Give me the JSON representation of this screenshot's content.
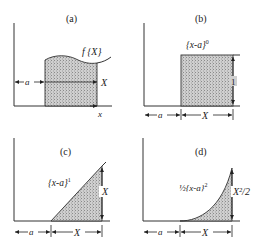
{
  "panels": [
    {
      "id": "a",
      "label": "(a)",
      "curve_label": "f {X}",
      "dims": {
        "offset": "a",
        "width": "X",
        "axis": "x"
      }
    },
    {
      "id": "b",
      "label": "(b)",
      "function_label": "{x-a}",
      "exponent": "0",
      "dims": {
        "offset": "a",
        "width": "X",
        "height": "1"
      }
    },
    {
      "id": "c",
      "label": "(c)",
      "function_label": "{x-a}",
      "exponent": "1",
      "dims": {
        "offset": "a",
        "width": "X",
        "height": "X"
      }
    },
    {
      "id": "d",
      "label": "(d)",
      "function_label": "½{x-a}",
      "exponent": "2",
      "dims": {
        "offset": "a",
        "width": "X",
        "height": "X²/2"
      }
    }
  ],
  "colors": {
    "ink": "#222222",
    "shade": "#bdbdbd",
    "background": "#ffffff"
  }
}
